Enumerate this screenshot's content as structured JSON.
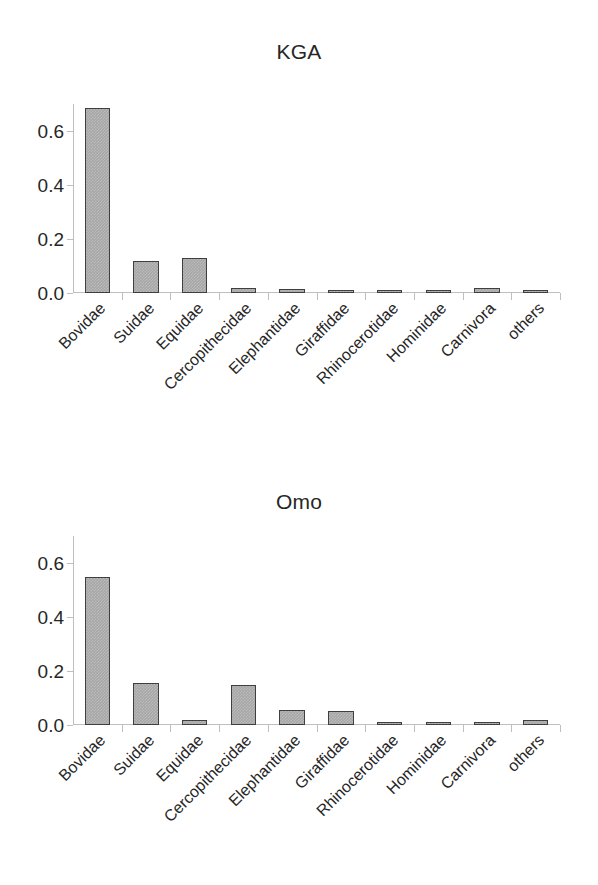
{
  "figure": {
    "background": "#ffffff",
    "bar_fill": "#a6a6a6",
    "bar_border": "#3f3f3f",
    "axis_color": "#bfbfbf",
    "text_color": "#262626"
  },
  "charts": [
    {
      "id": "kga",
      "title": "KGA",
      "ytick_labels": [
        "0.0",
        "0.2",
        "0.4",
        "0.6"
      ],
      "chart_data": {
        "type": "bar",
        "title": "KGA",
        "xlabel": "",
        "ylabel": "",
        "ylim": [
          0.0,
          0.7
        ],
        "yticks": [
          0.0,
          0.2,
          0.4,
          0.6
        ],
        "grid": false,
        "legend": "none",
        "categories": [
          "Bovidae",
          "Suidae",
          "Equidae",
          "Cercopithecidae",
          "Elephantidae",
          "Giraffidae",
          "Rhinocerotidae",
          "Hominidae",
          "Carnivora",
          "others"
        ],
        "values": [
          0.685,
          0.118,
          0.128,
          0.02,
          0.015,
          0.012,
          0.01,
          0.004,
          0.02,
          0.01
        ]
      }
    },
    {
      "id": "omo",
      "title": "Omo",
      "ytick_labels": [
        "0.0",
        "0.2",
        "0.4",
        "0.6"
      ],
      "chart_data": {
        "type": "bar",
        "title": "Omo",
        "xlabel": "",
        "ylabel": "",
        "ylim": [
          0.0,
          0.7
        ],
        "yticks": [
          0.0,
          0.2,
          0.4,
          0.6
        ],
        "grid": false,
        "legend": "none",
        "categories": [
          "Bovidae",
          "Suidae",
          "Equidae",
          "Cercopithecidae",
          "Elephantidae",
          "Giraffidae",
          "Rhinocerotidae",
          "Hominidae",
          "Carnivora",
          "others"
        ],
        "values": [
          0.548,
          0.155,
          0.02,
          0.148,
          0.055,
          0.053,
          0.008,
          0.01,
          0.007,
          0.018
        ]
      }
    }
  ]
}
